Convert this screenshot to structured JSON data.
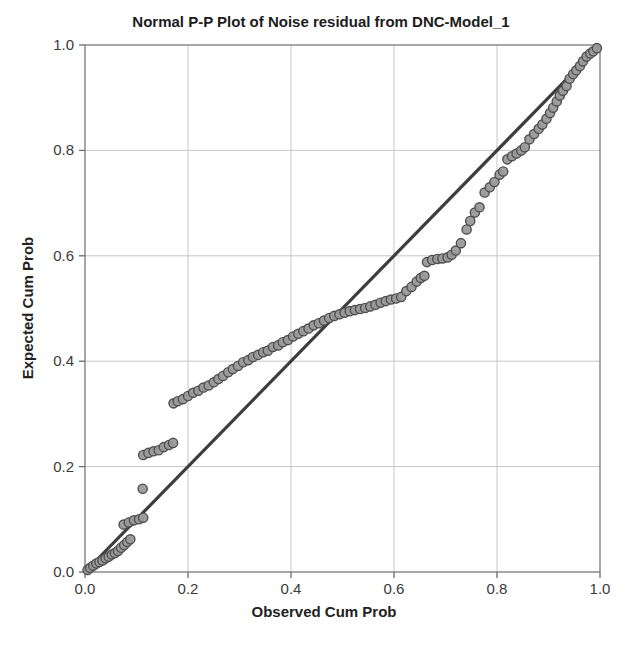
{
  "chart_data": {
    "type": "scatter",
    "title": "Normal P-P Plot of Noise residual from DNC-Model_1",
    "xlabel": "Observed Cum Prob",
    "ylabel": "Expected Cum Prob",
    "xlim": [
      0.0,
      1.0
    ],
    "ylim": [
      0.0,
      1.0
    ],
    "grid": true,
    "legend": "none",
    "x_ticks": {
      "values": [
        0.0,
        0.2,
        0.4,
        0.6,
        0.8,
        1.0
      ],
      "labels": [
        "0.0",
        "0.2",
        "0.4",
        "0.6",
        "0.8",
        "1.0"
      ]
    },
    "y_ticks": {
      "values": [
        0.0,
        0.2,
        0.4,
        0.6,
        0.8,
        1.0
      ],
      "labels": [
        "0.0",
        "0.2",
        "0.4",
        "0.6",
        "0.8",
        "1.0"
      ]
    },
    "reference_line": {
      "name": "identity-line",
      "from": [
        0.0,
        0.0
      ],
      "to": [
        1.0,
        1.0
      ],
      "color": "#3d3d3d",
      "width": 3.2
    },
    "marker": {
      "shape": "circle",
      "radius": 4.6,
      "fill": "#9a9a9a",
      "stroke": "#4f4f4f",
      "stroke_width": 1.4
    },
    "colors": {
      "grid": "#c6c6c6",
      "frame": "#8a8a8a",
      "tick": "#6a6a6a",
      "tick_label": "#3a3a3a",
      "background": "#ffffff"
    },
    "points": [
      [
        0.005,
        0.004
      ],
      [
        0.01,
        0.008
      ],
      [
        0.016,
        0.012
      ],
      [
        0.022,
        0.016
      ],
      [
        0.028,
        0.019
      ],
      [
        0.034,
        0.022
      ],
      [
        0.04,
        0.026
      ],
      [
        0.046,
        0.029
      ],
      [
        0.052,
        0.033
      ],
      [
        0.058,
        0.036
      ],
      [
        0.064,
        0.04
      ],
      [
        0.07,
        0.046
      ],
      [
        0.076,
        0.051
      ],
      [
        0.082,
        0.057
      ],
      [
        0.088,
        0.062
      ],
      [
        0.075,
        0.09
      ],
      [
        0.085,
        0.094
      ],
      [
        0.095,
        0.098
      ],
      [
        0.105,
        0.1
      ],
      [
        0.113,
        0.103
      ],
      [
        0.112,
        0.158
      ],
      [
        0.113,
        0.222
      ],
      [
        0.123,
        0.226
      ],
      [
        0.133,
        0.229
      ],
      [
        0.143,
        0.231
      ],
      [
        0.153,
        0.237
      ],
      [
        0.163,
        0.241
      ],
      [
        0.171,
        0.245
      ],
      [
        0.172,
        0.32
      ],
      [
        0.18,
        0.324
      ],
      [
        0.19,
        0.328
      ],
      [
        0.2,
        0.334
      ],
      [
        0.21,
        0.34
      ],
      [
        0.22,
        0.344
      ],
      [
        0.23,
        0.35
      ],
      [
        0.24,
        0.354
      ],
      [
        0.25,
        0.36
      ],
      [
        0.259,
        0.366
      ],
      [
        0.268,
        0.372
      ],
      [
        0.278,
        0.379
      ],
      [
        0.287,
        0.385
      ],
      [
        0.297,
        0.391
      ],
      [
        0.307,
        0.398
      ],
      [
        0.317,
        0.402
      ],
      [
        0.326,
        0.408
      ],
      [
        0.336,
        0.412
      ],
      [
        0.346,
        0.417
      ],
      [
        0.355,
        0.42
      ],
      [
        0.365,
        0.427
      ],
      [
        0.375,
        0.43
      ],
      [
        0.384,
        0.436
      ],
      [
        0.394,
        0.44
      ],
      [
        0.404,
        0.447
      ],
      [
        0.414,
        0.452
      ],
      [
        0.424,
        0.457
      ],
      [
        0.434,
        0.462
      ],
      [
        0.444,
        0.468
      ],
      [
        0.454,
        0.472
      ],
      [
        0.464,
        0.477
      ],
      [
        0.474,
        0.482
      ],
      [
        0.484,
        0.486
      ],
      [
        0.494,
        0.489
      ],
      [
        0.504,
        0.492
      ],
      [
        0.514,
        0.495
      ],
      [
        0.524,
        0.497
      ],
      [
        0.534,
        0.499
      ],
      [
        0.544,
        0.501
      ],
      [
        0.554,
        0.504
      ],
      [
        0.564,
        0.507
      ],
      [
        0.574,
        0.511
      ],
      [
        0.584,
        0.514
      ],
      [
        0.594,
        0.517
      ],
      [
        0.604,
        0.519
      ],
      [
        0.614,
        0.522
      ],
      [
        0.624,
        0.533
      ],
      [
        0.634,
        0.541
      ],
      [
        0.644,
        0.551
      ],
      [
        0.652,
        0.558
      ],
      [
        0.659,
        0.562
      ],
      [
        0.664,
        0.588
      ],
      [
        0.674,
        0.592
      ],
      [
        0.684,
        0.594
      ],
      [
        0.694,
        0.595
      ],
      [
        0.704,
        0.597
      ],
      [
        0.712,
        0.602
      ],
      [
        0.72,
        0.61
      ],
      [
        0.73,
        0.624
      ],
      [
        0.741,
        0.65
      ],
      [
        0.748,
        0.666
      ],
      [
        0.757,
        0.682
      ],
      [
        0.766,
        0.692
      ],
      [
        0.776,
        0.72
      ],
      [
        0.786,
        0.73
      ],
      [
        0.795,
        0.74
      ],
      [
        0.805,
        0.754
      ],
      [
        0.812,
        0.76
      ],
      [
        0.82,
        0.783
      ],
      [
        0.829,
        0.789
      ],
      [
        0.838,
        0.794
      ],
      [
        0.847,
        0.8
      ],
      [
        0.854,
        0.806
      ],
      [
        0.863,
        0.821
      ],
      [
        0.872,
        0.831
      ],
      [
        0.881,
        0.841
      ],
      [
        0.888,
        0.849
      ],
      [
        0.896,
        0.86
      ],
      [
        0.903,
        0.871
      ],
      [
        0.909,
        0.881
      ],
      [
        0.916,
        0.893
      ],
      [
        0.922,
        0.904
      ],
      [
        0.928,
        0.913
      ],
      [
        0.935,
        0.922
      ],
      [
        0.941,
        0.936
      ],
      [
        0.948,
        0.945
      ],
      [
        0.954,
        0.952
      ],
      [
        0.961,
        0.96
      ],
      [
        0.967,
        0.969
      ],
      [
        0.974,
        0.978
      ],
      [
        0.981,
        0.984
      ],
      [
        0.987,
        0.988
      ],
      [
        0.994,
        0.994
      ]
    ]
  }
}
